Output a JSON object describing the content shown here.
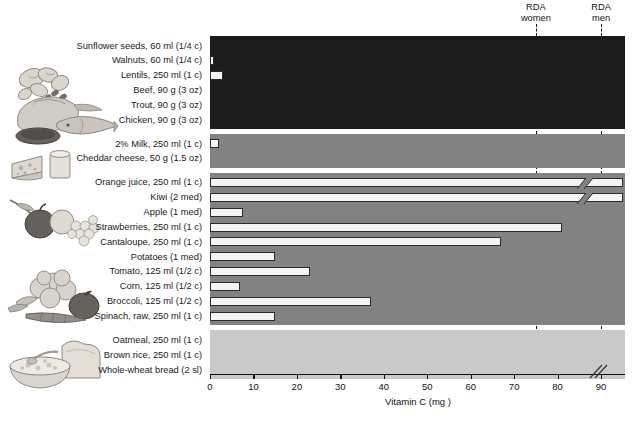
{
  "chart_data": {
    "type": "bar",
    "orientation": "horizontal",
    "title": "",
    "xlabel": "Vitamin C (mg )",
    "ylabel": "",
    "xlim": [
      0,
      95
    ],
    "xticks": [
      0,
      10,
      20,
      30,
      40,
      50,
      60,
      70,
      80,
      90
    ],
    "xticklabels": [
      "0",
      "10",
      "20",
      "30",
      "40",
      "50",
      "60",
      "70",
      "80",
      "90"
    ],
    "grid": false,
    "legend": "none",
    "axis_break": true,
    "axis_break_note": "x-axis is broken past 90 mg; Orange juice and Kiwi bars exceed the scale",
    "categories": [
      "Sunflower seeds, 60 ml (1/4 c)",
      "Walnuts, 60 ml (1/4 c)",
      "Lentils, 250 ml (1 c)",
      "Beef, 90 g (3 oz)",
      "Trout, 90 g (3 oz)",
      "Chicken, 90 g (3 oz)",
      "2% Milk, 250 ml (1 c)",
      "Cheddar cheese, 50 g (1.5 oz)",
      "Orange juice, 250 ml (1 c)",
      "Kiwi (2 med)",
      "Apple (1 med)",
      "Strawberries, 250 ml (1 c)",
      "Cantaloupe, 250 ml (1 c)",
      "Potatoes (1 med)",
      "Tomato, 125 ml (1/2 c)",
      "Corn, 125 ml (1/2 c)",
      "Broccoli, 125 ml (1/2 c)",
      "Spinach, raw, 250 ml (1 c)",
      "Oatmeal, 250 ml (1 c)",
      "Brown rice, 250 ml (1 c)",
      "Whole-wheat bread (2 sl)"
    ],
    "values": [
      0,
      1,
      3,
      0,
      0,
      0,
      2,
      0,
      97,
      97,
      7.5,
      81,
      67,
      15,
      23,
      7,
      37,
      15,
      0,
      0,
      0
    ],
    "broken": [
      false,
      false,
      false,
      false,
      false,
      false,
      false,
      false,
      true,
      true,
      false,
      false,
      false,
      false,
      false,
      false,
      false,
      false,
      false,
      false,
      false
    ],
    "annotations": [
      {
        "label": "RDA\nwomen",
        "line1": "RDA",
        "line2": "women",
        "x": 75
      },
      {
        "label": "RDA\nmen",
        "line1": "RDA",
        "line2": "men",
        "x": 90
      }
    ],
    "bands": [
      {
        "name": "protein-foods",
        "color": "#1c1c1c",
        "first": 0,
        "last": 5
      },
      {
        "name": "dairy",
        "color": "#828282",
        "first": 6,
        "last": 7
      },
      {
        "name": "fruits-and-vegetables",
        "color": "#828282",
        "first": 8,
        "last": 17
      },
      {
        "name": "grains",
        "color": "#c9c9c9",
        "first": 18,
        "last": 20
      }
    ]
  },
  "illustrations": [
    {
      "name": "seeds-and-nuts-illustration"
    },
    {
      "name": "meat-poultry-fish-illustration"
    },
    {
      "name": "cheese-and-milk-illustration"
    },
    {
      "name": "fruit-illustration"
    },
    {
      "name": "vegetables-illustration"
    },
    {
      "name": "grains-bread-and-oatmeal-illustration"
    }
  ],
  "colors": {
    "protein_band": "#1c1c1c",
    "dairy_band": "#828282",
    "produce_band": "#828282",
    "grain_band": "#c9c9c9",
    "bar_fill": "#f4f4f2",
    "bar_stroke": "#2b2b2b",
    "rda_line": "#111111",
    "page_background": "#ffffff"
  }
}
